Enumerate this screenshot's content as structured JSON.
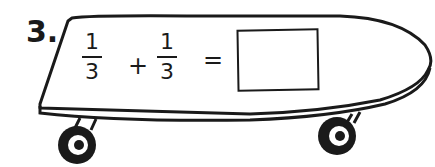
{
  "problem": {
    "number": "3.",
    "fraction1": {
      "numerator": "1",
      "denominator": "3"
    },
    "operator": "+",
    "fraction2": {
      "numerator": "1",
      "denominator": "3"
    },
    "equals": "=",
    "answer": ""
  },
  "illustration": {
    "subject": "skateboard",
    "colors": {
      "ink": "#1a1a1a",
      "background": "#ffffff"
    }
  }
}
